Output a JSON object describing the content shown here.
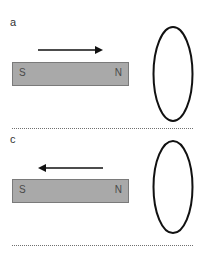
{
  "figure": {
    "panels": [
      {
        "label": "a",
        "magnet": {
          "left_pole": "S",
          "right_pole": "N",
          "fill": "#a9a9a9"
        },
        "motion_arrow": {
          "direction": "right",
          "icon": "arrow-right-icon"
        },
        "coil": {
          "shape": "ellipse",
          "icon": "coil-loop-icon"
        }
      },
      {
        "label": "c",
        "magnet": {
          "left_pole": "S",
          "right_pole": "N",
          "fill": "#a9a9a9"
        },
        "motion_arrow": {
          "direction": "left",
          "icon": "arrow-left-icon"
        },
        "coil": {
          "shape": "ellipse",
          "icon": "coil-loop-icon"
        }
      }
    ],
    "colors": {
      "stroke": "#111111",
      "magnet_fill": "#a9a9a9",
      "divider": "#707070"
    }
  }
}
